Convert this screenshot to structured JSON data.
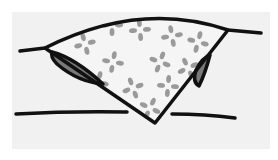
{
  "diagram": {
    "colors": {
      "background": "#ffffff",
      "panel": "#f1f1f1",
      "stroke": "#111111",
      "wedge_fill": "#f4f4f4",
      "speckle": "#9a9a9a",
      "lens_fill": "#7a7a7a"
    },
    "elements": [
      {
        "name": "upper-curve",
        "type": "curved line"
      },
      {
        "name": "lower-line",
        "type": "horizontal line"
      },
      {
        "name": "wedge",
        "type": "speckled triangle"
      },
      {
        "name": "left-lens",
        "type": "dark lens shape"
      },
      {
        "name": "right-lens",
        "type": "dark lens shape"
      }
    ]
  }
}
